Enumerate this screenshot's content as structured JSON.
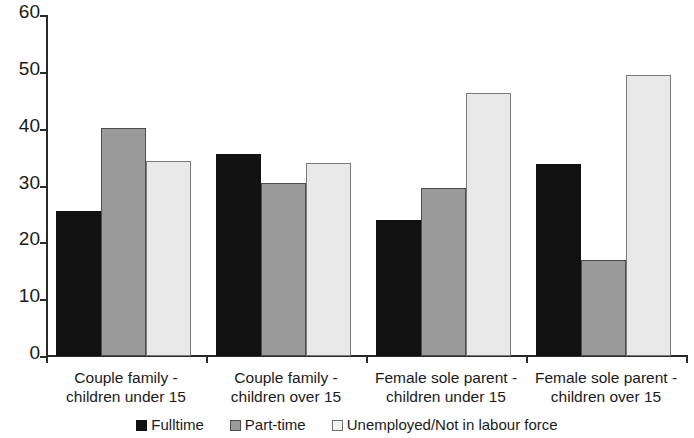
{
  "chart_data": {
    "type": "bar",
    "title": "",
    "subtitle": "",
    "xlabel": "",
    "ylabel": "",
    "ylim": [
      0,
      60
    ],
    "ytick_labels": [
      "60",
      "50",
      "40",
      "30",
      "20",
      "10",
      "0"
    ],
    "ytick_values": [
      60,
      50,
      40,
      30,
      20,
      10,
      0
    ],
    "grid": false,
    "legend_position": "bottom",
    "categories": [
      "Couple family - children under 15",
      "Couple family - children over 15",
      "Female sole parent - children under 15",
      "Female sole parent - children over 15"
    ],
    "category_lines": [
      [
        "Couple family -",
        "children under 15"
      ],
      [
        "Couple family -",
        "children over 15"
      ],
      [
        "Female sole parent -",
        "children under 15"
      ],
      [
        "Female sole parent -",
        "children over 15"
      ]
    ],
    "series": [
      {
        "name": "Fulltime",
        "color": "#111111",
        "values": [
          25.5,
          35.6,
          24.0,
          33.8
        ]
      },
      {
        "name": "Part-time",
        "color": "#9a9a9a",
        "values": [
          40.2,
          30.5,
          29.6,
          16.9
        ]
      },
      {
        "name": "Unemployed/Not in labour force",
        "color": "#e9e9e9",
        "values": [
          34.3,
          34.0,
          46.3,
          49.4
        ]
      }
    ]
  },
  "legend": {
    "items": [
      {
        "label": "Fulltime",
        "swatch": "fulltime-swatch"
      },
      {
        "label": "Part-time",
        "swatch": "parttime-swatch"
      },
      {
        "label": "Unemployed/Not in labour force",
        "swatch": "unemployed-swatch"
      }
    ]
  }
}
